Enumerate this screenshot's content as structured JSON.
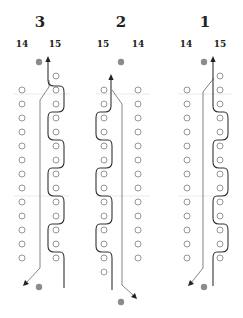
{
  "diagram": {
    "colors": {
      "hole_stroke": "#8a8a8a",
      "dot": "#8c8c8c",
      "line_thin": "#777777",
      "line_bold": "#333333",
      "guide": "#e2e2e2"
    },
    "row_spacing": 14,
    "panels": [
      {
        "id": "panel-3",
        "title": "3",
        "title_x": 40,
        "labels": [
          {
            "text": "14",
            "x": 22
          },
          {
            "text": "15",
            "x": 55
          }
        ],
        "left_col_x": 22,
        "right_col_x": 56,
        "left_rows": [
          90,
          104,
          118,
          132,
          146,
          160,
          174,
          188,
          202,
          216,
          230,
          244,
          258
        ],
        "right_rows": [
          76,
          90,
          104,
          118,
          132,
          146,
          160,
          174,
          188,
          202,
          216,
          230,
          244,
          258
        ],
        "top_dot": {
          "x": 39,
          "y": 62
        },
        "bottom_dot": {
          "x": 39,
          "y": 287
        },
        "thin_path": "M49,80 L49,87 L40,100 L40,268 L26,283",
        "thin_arrow": {
          "x": 24,
          "y": 285,
          "dir": "down-left"
        },
        "bold_path": "M48,60 L48,80 Q48,86 54,86 L60,86 Q64,86 64,92 L64,106 Q64,112 58,112 L52,112 Q48,112 48,118 L48,134 Q48,140 54,140 L60,140 Q64,140 64,146 L64,162 Q64,168 58,168 L52,168 Q48,168 48,174 L48,190 Q48,196 54,196 L60,196 Q64,196 64,202 L64,218 Q64,224 58,224 L52,224 Q48,224 48,230 L48,246 Q48,252 54,252 L60,252 Q64,252 64,258 L64,288",
        "bold_arrow": {
          "x": 48,
          "y": 58,
          "dir": "up"
        }
      },
      {
        "id": "panel-2",
        "title": "2",
        "title_x": 121,
        "labels": [
          {
            "text": "15",
            "x": 103
          },
          {
            "text": "14",
            "x": 138
          }
        ],
        "left_col_x": 104,
        "right_col_x": 138,
        "left_rows": [
          90,
          104,
          118,
          132,
          146,
          160,
          174,
          188,
          202,
          216,
          230,
          244,
          258,
          272
        ],
        "right_rows": [
          90,
          104,
          118,
          132,
          146,
          160,
          174,
          188,
          202,
          216,
          230,
          244,
          258
        ],
        "top_dot": {
          "x": 121,
          "y": 62
        },
        "bottom_dot": {
          "x": 121,
          "y": 302
        },
        "thin_path": "M112,90 L122,104 L122,285 L134,296",
        "thin_arrow": {
          "x": 136,
          "y": 298,
          "dir": "down-right"
        },
        "bold_path": "M111,78 L111,106 Q111,112 105,112 L100,112 Q96,112 96,118 L96,134 Q96,140 102,140 L108,140 Q112,140 112,146 L112,162 Q112,168 106,168 L100,168 Q96,168 96,174 L96,190 Q96,196 102,196 L108,196 Q112,196 112,202 L112,218 Q112,224 106,224 L100,224 Q96,224 96,230 L96,246 Q96,252 102,252 L108,252 Q112,252 112,258 L112,290",
        "bold_arrow": {
          "x": 111,
          "y": 76,
          "dir": "up"
        }
      },
      {
        "id": "panel-1",
        "title": "1",
        "title_x": 205,
        "labels": [
          {
            "text": "14",
            "x": 186
          },
          {
            "text": "15",
            "x": 220
          }
        ],
        "left_col_x": 187,
        "right_col_x": 220,
        "left_rows": [
          90,
          104,
          118,
          132,
          146,
          160,
          174,
          188,
          202,
          216,
          230,
          244,
          258
        ],
        "right_rows": [
          76,
          90,
          104,
          118,
          132,
          146,
          160,
          174,
          188,
          202,
          216,
          230,
          244,
          258
        ],
        "top_dot": {
          "x": 204,
          "y": 62
        },
        "bottom_dot": {
          "x": 204,
          "y": 287
        },
        "thin_path": "M214,78 L203,92 L203,268 L191,283",
        "thin_arrow": {
          "x": 189,
          "y": 285,
          "dir": "down-left"
        },
        "bold_path": "M213,60 L213,106 Q213,112 219,112 L224,112 Q228,112 228,118 L228,134 Q228,140 222,140 L217,140 Q213,140 213,146 L213,162 Q213,168 219,168 L224,168 Q228,168 228,174 L228,190 Q228,196 222,196 L217,196 Q213,196 213,202 L213,218 Q213,224 219,224 L224,224 Q228,224 228,230 L228,246 Q228,252 222,252 L217,252 Q213,252 213,258 L213,286",
        "bold_arrow": {
          "x": 213,
          "y": 58,
          "dir": "up"
        }
      }
    ],
    "guides": [
      {
        "x1": 14,
        "x2": 70,
        "y": 94
      },
      {
        "x1": 14,
        "x2": 70,
        "y": 196
      },
      {
        "x1": 96,
        "x2": 150,
        "y": 94
      },
      {
        "x1": 96,
        "x2": 150,
        "y": 196
      },
      {
        "x1": 178,
        "x2": 232,
        "y": 94
      },
      {
        "x1": 178,
        "x2": 232,
        "y": 196
      }
    ]
  }
}
